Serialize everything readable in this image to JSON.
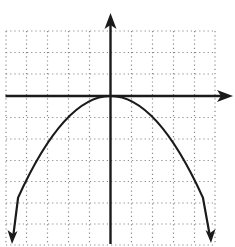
{
  "diagram": {
    "type": "coordinate-plane-graph",
    "function": "y = -x^2/4",
    "vertex": [
      0,
      0
    ],
    "opens": "down",
    "grid": {
      "style": "dotted",
      "color": "#8a8a8a",
      "x_range_units": [
        -5,
        5
      ],
      "y_range_units": [
        -7,
        3
      ],
      "vertical_lines_px": [
        6,
        26.5,
        47.5,
        68.5,
        89.5,
        131.5,
        152.5,
        173.5,
        194.5,
        215
      ],
      "horizontal_lines_px": [
        31,
        52.5,
        74,
        117.5,
        139,
        160.5,
        181.5,
        203,
        224,
        245
      ]
    },
    "axes": {
      "color": "#1a1a1a",
      "origin_px": [
        110.5,
        96
      ],
      "x_axis": {
        "from_px": [
          5.5,
          96
        ],
        "arrow_tip_px": [
          233,
          96
        ],
        "arrow": "right"
      },
      "y_axis": {
        "from_px": [
          110.5,
          244
        ],
        "arrow_tip_px": [
          110.5,
          13
        ],
        "arrow": "up"
      }
    },
    "curve": {
      "color": "#1a1a1a",
      "start_px": [
        18.1,
        197.6
      ],
      "control_px": [
        110.5,
        -5.6
      ],
      "end_px": [
        202.9,
        197.6
      ],
      "left_tail_px": [
        13.5,
        234
      ],
      "right_tail_px": [
        209.5,
        234
      ],
      "left_arrow_tip_px": [
        12,
        244
      ],
      "right_arrow_tip_px": [
        211,
        243
      ],
      "arrows": "both ends pointing down"
    },
    "labels": []
  }
}
